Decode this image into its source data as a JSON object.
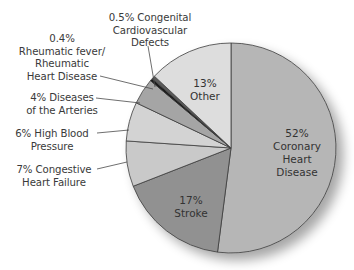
{
  "chart_data": {
    "type": "pie",
    "title": "",
    "start_angle_deg": 0,
    "direction": "clockwise",
    "slices": [
      {
        "name": "Coronary Heart Disease",
        "value": 52,
        "label_pct": "52%",
        "label_lines": [
          "Coronary",
          "Heart",
          "Disease"
        ],
        "color": "#b6b6b6",
        "label_position": "inside"
      },
      {
        "name": "Stroke",
        "value": 17,
        "label_pct": "17%",
        "label_lines": [
          "Stroke"
        ],
        "color": "#919191",
        "label_position": "inside"
      },
      {
        "name": "Congestive Heart Failure",
        "value": 7,
        "label_pct": "7%",
        "label_lines": [
          "7% Congestive",
          "Heart Failure"
        ],
        "color": "#c9c9c9",
        "label_position": "outside"
      },
      {
        "name": "High Blood Pressure",
        "value": 6,
        "label_pct": "6%",
        "label_lines": [
          "6% High Blood",
          "Pressure"
        ],
        "color": "#d3d3d3",
        "label_position": "outside"
      },
      {
        "name": "Diseases of the Arteries",
        "value": 4,
        "label_pct": "4%",
        "label_lines": [
          "4% Diseases",
          "of the Arteries"
        ],
        "color": "#a5a5a5",
        "label_position": "outside"
      },
      {
        "name": "Rheumatic fever/Rheumatic Heart Disease",
        "value": 0.4,
        "label_pct": "0.4%",
        "label_lines": [
          "0.4%",
          "Rheumatic fever/",
          "Rheumatic",
          "Heart Disease"
        ],
        "color": "#1a1a1a",
        "label_position": "outside"
      },
      {
        "name": "Congenital Cardiovascular Defects",
        "value": 0.5,
        "label_pct": "0.5%",
        "label_lines": [
          "0.5% Congenital",
          "Cardiovascular",
          "Defects"
        ],
        "color": "#5a5a5a",
        "label_position": "outside"
      },
      {
        "name": "Other",
        "value": 13,
        "label_pct": "13%",
        "label_lines": [
          "Other"
        ],
        "color": "#dddddd",
        "label_position": "inside"
      }
    ],
    "legend": null,
    "grid": false
  },
  "labels": {
    "coronary": {
      "pct": "52%",
      "l1": "Coronary",
      "l2": "Heart",
      "l3": "Disease"
    },
    "stroke": {
      "pct": "17%",
      "l1": "Stroke"
    },
    "other": {
      "pct": "13%",
      "l1": "Other"
    },
    "chf": {
      "l1": "7% Congestive",
      "l2": "Heart Failure"
    },
    "hbp": {
      "l1": "6% High Blood",
      "l2": "Pressure"
    },
    "arteries": {
      "l1": "4% Diseases",
      "l2": "of the Arteries"
    },
    "rheumatic": {
      "l1": "0.4%",
      "l2": "Rheumatic fever/",
      "l3": "Rheumatic",
      "l4": "Heart Disease"
    },
    "congenital": {
      "l1": "0.5% Congenital",
      "l2": "Cardiovascular",
      "l3": "Defects"
    }
  },
  "style": {
    "outline_color": "#3c3c3c",
    "leader_color": "#4a4a4a",
    "shadow_color": "#9a9a9a"
  }
}
